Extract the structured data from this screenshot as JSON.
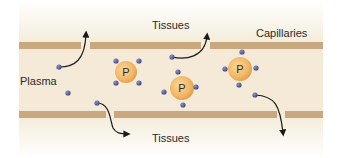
{
  "diagram": {
    "type": "capillary plasma protein diagram",
    "labels": {
      "tissues_top": "Tissues",
      "capillaries": "Capillaries",
      "plasma": "Plasma",
      "tissues_bottom": "Tissues"
    },
    "proteins": [
      {
        "id": "protein-1",
        "label": "P",
        "cx": 126,
        "cy": 72,
        "r": 11,
        "bound_solutes": 4
      },
      {
        "id": "protein-2",
        "label": "P",
        "cx": 182,
        "cy": 88,
        "r": 12,
        "bound_solutes": 4
      },
      {
        "id": "protein-3",
        "label": "P",
        "cx": 240,
        "cy": 69,
        "r": 12,
        "bound_solutes": 4
      }
    ],
    "free_solutes": [
      {
        "id": "solute-1",
        "cx": 59,
        "cy": 67,
        "exits_to": "tissues_top"
      },
      {
        "id": "solute-2",
        "cx": 68,
        "cy": 93,
        "exits_to": null
      },
      {
        "id": "solute-3",
        "cx": 97,
        "cy": 103,
        "exits_to": "tissues_bottom"
      },
      {
        "id": "solute-4",
        "cx": 172,
        "cy": 57,
        "exits_to": "tissues_top"
      },
      {
        "id": "solute-5",
        "cx": 255,
        "cy": 95,
        "exits_to": "tissues_bottom"
      }
    ],
    "colors": {
      "background_plasma": "#f5ead7",
      "background_tissue": "#f6f1e2",
      "membrane": "#c9a77f",
      "protein_fill": "#f0b565",
      "protein_edge": "#e39b42",
      "solute": "#4a5590",
      "arrow": "#1a1a1a"
    }
  }
}
